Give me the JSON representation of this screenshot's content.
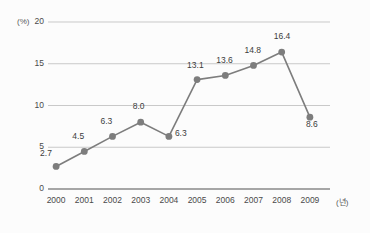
{
  "chart_data": {
    "type": "line",
    "title": "",
    "xlabel": "(년)",
    "ylabel": "(%)",
    "categories": [
      "2000",
      "2001",
      "2002",
      "2003",
      "2004",
      "2005",
      "2006",
      "2007",
      "2008",
      "2009"
    ],
    "values": [
      2.7,
      4.5,
      6.3,
      8.0,
      6.3,
      13.1,
      13.6,
      14.8,
      16.4,
      8.6
    ],
    "point_labels": [
      "2.7",
      "4.5",
      "6.3",
      "8.0",
      "6.3",
      "13.1",
      "13.6",
      "14.8",
      "16.4",
      "8.6"
    ],
    "ylim": [
      0,
      20
    ],
    "yticks": [
      "0",
      "5",
      "10",
      "15",
      "20"
    ],
    "ytick_values": [
      0,
      5,
      10,
      15,
      20
    ],
    "grid": true,
    "legend": "none",
    "series_color": "#7d7d7d",
    "grid_color": "#c9c9c9",
    "axis_color": "#8a8a8a",
    "marker": "circle"
  },
  "axes": {
    "y_unit_label": "(%)",
    "x_unit_label": "(년)"
  }
}
